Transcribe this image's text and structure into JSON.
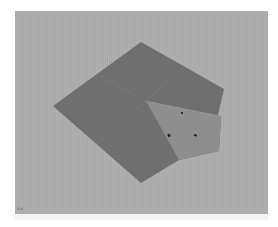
{
  "viewport": {
    "background": "#acacac",
    "axis_indicator": "z x",
    "mesh": {
      "dark_face_color": "#6f6f6f",
      "light_face_color": "#8e8e8e",
      "edge_line_color": "#7e7e7e",
      "outline_points": "38,95 126,31 209,78 203,104 206,106 204,140 164,149 126,172",
      "light_region_points": "131,90 203,104 206,106 204,140 164,149",
      "center": "131,90",
      "markers": [
        {
          "x": 167,
          "y": 102,
          "size": 1.2
        },
        {
          "x": 154,
          "y": 125,
          "size": 1.8
        },
        {
          "x": 180,
          "y": 124,
          "size": 1.8
        }
      ]
    }
  }
}
